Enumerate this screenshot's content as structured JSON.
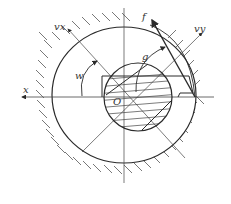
{
  "diagram": {
    "type": "mechanical-cross-section",
    "labels": {
      "x_axis": "x",
      "vx": "vx",
      "vy": "vy",
      "f": "f",
      "g": "g",
      "angle": "w",
      "origin": "O"
    },
    "colors": {
      "line": "#2a2a2a",
      "hatch": "#555555",
      "background": "#ffffff"
    }
  }
}
